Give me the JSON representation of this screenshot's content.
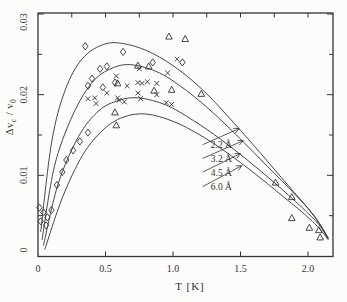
{
  "figure": {
    "background": "#fcfcfa",
    "ink": "#333333",
    "x_axis": {
      "title": "T [K]",
      "tick_labels": [
        "0",
        "0.5",
        "1.0",
        "1.5",
        "2.0"
      ],
      "tick_values": [
        0,
        0.5,
        1.0,
        1.5,
        2.0
      ]
    },
    "y_axis": {
      "title_part1": "Δv",
      "title_sub1": "c",
      "title_part2": " / v",
      "title_sub2": "0",
      "tick_labels": [
        "0",
        "0.01",
        "0.02",
        "0.03"
      ],
      "tick_values": [
        0,
        0.01,
        0.02,
        0.03
      ]
    }
  },
  "chart_data": {
    "type": "line",
    "title": "",
    "xlabel": "T [K]",
    "ylabel": "Δv_c / v_0",
    "xlim": [
      0,
      2.185
    ],
    "ylim": [
      0,
      0.03
    ],
    "grid": false,
    "x_major_ticks": [
      0,
      0.5,
      1.0,
      1.5,
      2.0
    ],
    "x_top_minor_ticks": [
      0.25,
      0.5,
      0.75,
      1.0,
      1.25,
      1.5,
      1.75,
      2.0
    ],
    "y_major_ticks": [
      0.01,
      0.02,
      0.03
    ],
    "y_minor_ticks": [
      0.005,
      0.015,
      0.025
    ],
    "series": [
      {
        "name": "2.2 Å",
        "type": "curve",
        "points": [
          [
            0.02,
            0.003
          ],
          [
            0.1,
            0.014
          ],
          [
            0.2,
            0.0205
          ],
          [
            0.33,
            0.0245
          ],
          [
            0.5,
            0.0263
          ],
          [
            0.67,
            0.0262
          ],
          [
            0.85,
            0.0251
          ],
          [
            1.05,
            0.023
          ],
          [
            1.25,
            0.0201
          ],
          [
            1.45,
            0.0165
          ],
          [
            1.65,
            0.0127
          ],
          [
            1.85,
            0.0088
          ],
          [
            2.0,
            0.0059
          ],
          [
            2.1,
            0.0036
          ],
          [
            2.15,
            0.0022
          ]
        ]
      },
      {
        "name": "3.2 Å",
        "type": "curve",
        "points": [
          [
            0.03,
            0.002
          ],
          [
            0.12,
            0.011
          ],
          [
            0.25,
            0.0172
          ],
          [
            0.4,
            0.0215
          ],
          [
            0.55,
            0.0233
          ],
          [
            0.7,
            0.0237
          ],
          [
            0.9,
            0.0227
          ],
          [
            1.1,
            0.0205
          ],
          [
            1.3,
            0.0177
          ],
          [
            1.5,
            0.0145
          ],
          [
            1.7,
            0.0111
          ],
          [
            1.9,
            0.0077
          ],
          [
            2.05,
            0.0049
          ],
          [
            2.15,
            0.0022
          ]
        ]
      },
      {
        "name": "4.5 Å",
        "type": "curve",
        "points": [
          [
            0.04,
            0.0013
          ],
          [
            0.15,
            0.009
          ],
          [
            0.3,
            0.0148
          ],
          [
            0.45,
            0.018
          ],
          [
            0.6,
            0.0193
          ],
          [
            0.75,
            0.0196
          ],
          [
            0.95,
            0.0187
          ],
          [
            1.15,
            0.0168
          ],
          [
            1.35,
            0.0145
          ],
          [
            1.55,
            0.0119
          ],
          [
            1.75,
            0.0091
          ],
          [
            1.95,
            0.0061
          ],
          [
            2.08,
            0.0039
          ],
          [
            2.15,
            0.0021
          ]
        ]
      },
      {
        "name": "6.0 Å",
        "type": "curve",
        "points": [
          [
            0.05,
            0.0008
          ],
          [
            0.18,
            0.0072
          ],
          [
            0.33,
            0.0125
          ],
          [
            0.48,
            0.0156
          ],
          [
            0.63,
            0.0172
          ],
          [
            0.8,
            0.0176
          ],
          [
            1.0,
            0.0167
          ],
          [
            1.2,
            0.015
          ],
          [
            1.4,
            0.0128
          ],
          [
            1.6,
            0.0103
          ],
          [
            1.8,
            0.0076
          ],
          [
            2.0,
            0.0048
          ],
          [
            2.1,
            0.0031
          ],
          [
            2.15,
            0.002
          ]
        ]
      }
    ],
    "scatter": [
      {
        "name": "diamond-points",
        "marker": "diamond",
        "points": [
          [
            0.01,
            0.006
          ],
          [
            0.04,
            0.0054
          ],
          [
            0.07,
            0.0048
          ],
          [
            0.02,
            0.0043
          ],
          [
            0.06,
            0.0038
          ],
          [
            0.1,
            0.0057
          ],
          [
            0.14,
            0.0088
          ],
          [
            0.18,
            0.0104
          ],
          [
            0.21,
            0.0119
          ],
          [
            0.26,
            0.0131
          ],
          [
            0.31,
            0.0142
          ],
          [
            0.37,
            0.0153
          ],
          [
            0.35,
            0.026
          ],
          [
            0.63,
            0.0253
          ],
          [
            0.46,
            0.0232
          ],
          [
            0.51,
            0.0235
          ],
          [
            0.4,
            0.022
          ],
          [
            0.37,
            0.0211
          ],
          [
            0.48,
            0.0209
          ],
          [
            0.57,
            0.0215
          ],
          [
            0.85,
            0.024
          ],
          [
            1.07,
            0.024
          ]
        ]
      },
      {
        "name": "cross-points",
        "marker": "cross",
        "points": [
          [
            0.58,
            0.0223
          ],
          [
            0.66,
            0.0211
          ],
          [
            0.74,
            0.0215
          ],
          [
            0.77,
            0.0214
          ],
          [
            0.81,
            0.0216
          ],
          [
            0.88,
            0.0214
          ],
          [
            0.74,
            0.0202
          ],
          [
            0.51,
            0.0202
          ],
          [
            0.42,
            0.0196
          ],
          [
            0.59,
            0.0196
          ],
          [
            0.37,
            0.0195
          ],
          [
            0.43,
            0.0189
          ],
          [
            0.6,
            0.0193
          ],
          [
            0.64,
            0.0191
          ],
          [
            0.76,
            0.0195
          ],
          [
            0.95,
            0.019
          ],
          [
            0.99,
            0.0188
          ],
          [
            1.03,
            0.0244
          ],
          [
            0.75,
            0.0232
          ],
          [
            0.96,
            0.0227
          ],
          [
            0.88,
            0.02
          ]
        ]
      },
      {
        "name": "triangle-points",
        "marker": "triangle",
        "points": [
          [
            0.97,
            0.0272
          ],
          [
            1.09,
            0.0269
          ],
          [
            0.74,
            0.0236
          ],
          [
            0.82,
            0.0235
          ],
          [
            0.99,
            0.0206
          ],
          [
            0.59,
            0.0214
          ],
          [
            0.86,
            0.0205
          ],
          [
            0.57,
            0.0178
          ],
          [
            0.58,
            0.0162
          ],
          [
            1.21,
            0.0201
          ],
          [
            1.76,
            0.0091
          ],
          [
            1.88,
            0.0073
          ],
          [
            1.88,
            0.0047
          ],
          [
            2.01,
            0.0035
          ],
          [
            2.08,
            0.0032
          ],
          [
            2.09,
            0.0023
          ]
        ]
      }
    ],
    "legend": {
      "position": "center-right-inside",
      "items": [
        {
          "label": "2.2 Å",
          "label_anchor": [
            1.17,
            0.0138
          ],
          "arrow_from": [
            1.22,
            0.0138
          ],
          "arrow_to": [
            1.49,
            0.0158
          ]
        },
        {
          "label": "3.2 Å",
          "label_anchor": [
            1.17,
            0.0121
          ],
          "arrow_from": [
            1.22,
            0.0121
          ],
          "arrow_to": [
            1.52,
            0.0143
          ]
        },
        {
          "label": "4.5 Å",
          "label_anchor": [
            1.17,
            0.0104
          ],
          "arrow_from": [
            1.22,
            0.0104
          ],
          "arrow_to": [
            1.5,
            0.0127
          ]
        },
        {
          "label": "6.0 Å",
          "label_anchor": [
            1.17,
            0.0086
          ],
          "arrow_from": [
            1.22,
            0.0086
          ],
          "arrow_to": [
            1.51,
            0.0112
          ]
        }
      ]
    }
  }
}
